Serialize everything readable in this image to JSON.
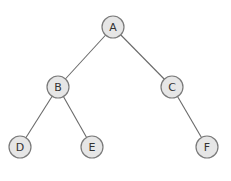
{
  "diagram": {
    "type": "binary-tree",
    "nodes": [
      {
        "id": "A",
        "label": "A",
        "x": 113,
        "y": 27
      },
      {
        "id": "B",
        "label": "B",
        "x": 58,
        "y": 87
      },
      {
        "id": "C",
        "label": "C",
        "x": 172,
        "y": 87
      },
      {
        "id": "D",
        "label": "D",
        "x": 20,
        "y": 147
      },
      {
        "id": "E",
        "label": "E",
        "x": 92,
        "y": 147
      },
      {
        "id": "F",
        "label": "F",
        "x": 207,
        "y": 147
      }
    ],
    "edges": [
      {
        "from": "A",
        "to": "B"
      },
      {
        "from": "A",
        "to": "C"
      },
      {
        "from": "B",
        "to": "D"
      },
      {
        "from": "B",
        "to": "E"
      },
      {
        "from": "C",
        "to": "F"
      }
    ],
    "node_fill": "#e6e6e6",
    "node_stroke": "#7a7a7a",
    "edge_color": "#6a6a6a"
  }
}
